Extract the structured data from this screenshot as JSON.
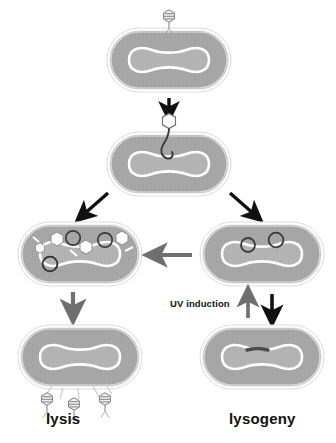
{
  "figure": {
    "background_color": "#ffffff"
  },
  "palette": {
    "cell_fill": "#a8a8a8",
    "cell_outline": "#d4d4d4",
    "cell_outline_inner": "#8f8f8f",
    "nucleoid_fill": "#b4b4b4",
    "nucleoid_outline": "#ffffff",
    "capsid_fill": "#ffffff",
    "capsid_stroke": "#6f6f6f",
    "phage_dna_stroke": "#3a3a3a",
    "prophage_color": "#4a4a4a",
    "arrow_black": "#111111",
    "arrow_gray": "#6f6f6f",
    "label_color": "#111111"
  },
  "labels": {
    "lysis": "lysis",
    "lysogeny": "lysogeny",
    "uv_induction": "UV induction"
  },
  "stages": [
    {
      "id": "infection",
      "name": "phage-adsorption-and-infection",
      "position": {
        "x": 107,
        "y": 28,
        "w": 124,
        "h": 64
      },
      "description": "Intact bacteriophage attached to bacterial cell surface",
      "phage_count": 1,
      "free_dna": false
    },
    {
      "id": "injection",
      "name": "dna-injection",
      "position": {
        "x": 107,
        "y": 125,
        "w": 124,
        "h": 64
      },
      "description": "Empty phage capsid injecting linear DNA into host cytoplasm",
      "phage_count": 1,
      "free_dna": true
    },
    {
      "id": "lytic-assembly",
      "name": "lytic-replication-assembly",
      "position": {
        "x": 18,
        "y": 222,
        "w": 124,
        "h": 62
      },
      "description": "Host cell filled with newly assembled capsids, phage DNA circles and tail fibers",
      "capsids": 4,
      "dna_circles": 3,
      "tail_fibers": 3
    },
    {
      "id": "lysogenic-circular",
      "name": "circularized-phage-dna",
      "position": {
        "x": 200,
        "y": 222,
        "w": 124,
        "h": 62
      },
      "description": "Phage DNA circularized inside host cell prior to integration",
      "dna_circles": 2
    },
    {
      "id": "lysis-burst",
      "name": "cell-lysis-releasing-phages",
      "position": {
        "x": 18,
        "y": 325,
        "w": 124,
        "h": 62
      },
      "description": "Host cell bursting and releasing progeny phage particles",
      "released_phages": 3
    },
    {
      "id": "lysogen",
      "name": "lysogenic-cell-with-prophage",
      "position": {
        "x": 200,
        "y": 325,
        "w": 124,
        "h": 62
      },
      "description": "Prophage integrated into the bacterial chromosome",
      "prophage": true
    }
  ],
  "arrows": [
    {
      "id": "a1",
      "name": "arrow-infection-to-injection",
      "style": "black",
      "direction": "down",
      "from": "infection",
      "to": "injection"
    },
    {
      "id": "a2",
      "name": "arrow-branch-to-lytic",
      "style": "black",
      "direction": "down-left",
      "from": "injection",
      "to": "lytic-assembly"
    },
    {
      "id": "a3",
      "name": "arrow-branch-to-lysogenic",
      "style": "black",
      "direction": "down-right",
      "from": "injection",
      "to": "lysogenic-circular"
    },
    {
      "id": "a4",
      "name": "arrow-lysogenic-to-lytic",
      "style": "gray",
      "direction": "left",
      "from": "lysogenic-circular",
      "to": "lytic-assembly"
    },
    {
      "id": "a5",
      "name": "arrow-lytic-to-lysis",
      "style": "gray",
      "direction": "down",
      "from": "lytic-assembly",
      "to": "lysis-burst"
    },
    {
      "id": "a6",
      "name": "arrow-uv-induction-up",
      "style": "gray",
      "direction": "up",
      "from": "lysogen",
      "to": "lysogenic-circular"
    },
    {
      "id": "a7",
      "name": "arrow-integration-down",
      "style": "black",
      "direction": "down",
      "from": "lysogenic-circular",
      "to": "lysogen"
    }
  ]
}
